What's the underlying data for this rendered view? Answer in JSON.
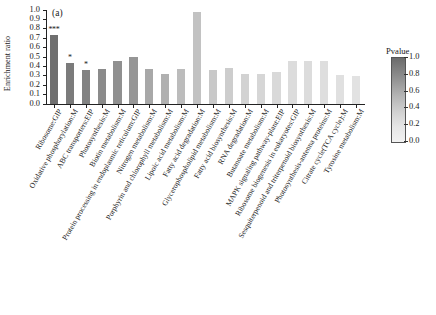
{
  "panel": {
    "letter": "(a)"
  },
  "axis": {
    "ylabel": "Enrichment ratio",
    "yticks": [
      "1.0",
      "0.9",
      "0.8",
      "0.7",
      "0.6",
      "0.5",
      "0.4",
      "0.3",
      "0.2",
      "0.1",
      "0.0"
    ]
  },
  "colorbar": {
    "title": "Pvalue",
    "ticks": [
      "1.0",
      "0.8",
      "0.6",
      "0.4",
      "0.2",
      "0.0"
    ],
    "dark_end": "#6b6b6b",
    "light_end": "#f2f2f2"
  },
  "chart_data": {
    "type": "bar",
    "title": "",
    "xlabel": "",
    "ylabel": "Enrichment ratio",
    "ylim": [
      0.0,
      1.0
    ],
    "grid": false,
    "legend": {
      "title": "Pvalue",
      "position": "right",
      "range": [
        0.0,
        1.0
      ],
      "colormap": "grayscale, dark = 1.0, light = 0.0"
    },
    "categories": [
      "Ribosome:GIP",
      "Oxidative phosphorylation:M",
      "ABC transporters:EIP",
      "Photosynthesis:M",
      "Biotin metabolism:M",
      "Protein processing in endoplasmic reticulum:GIP",
      "Nitrogen metabolism:M",
      "Porphyrin and chlorophyll metabolism:M",
      "Lipoic acid metabolism:M",
      "Fatty acid degradation:M",
      "Glycerophospholipid metabolism:M",
      "Fatty acid biosynthesis:M",
      "RNA degradation:M",
      "Butanoate metabolism:M",
      "MAPK signaling pathway-plant:EIP",
      "Ribosome biogenesis in eukaryotes:GIP",
      "Sesquiterpenoid and triterpenoid biosynthesis:M",
      "Photosynthesis-antenna proteins:M",
      "Citrate cycle(TCA cycle):M",
      "Tyrosine metabolism:M"
    ],
    "values": [
      0.73,
      0.43,
      0.36,
      0.37,
      0.45,
      0.49,
      0.37,
      0.31,
      0.37,
      0.97,
      0.36,
      0.38,
      0.31,
      0.31,
      0.33,
      0.45,
      0.45,
      0.45,
      0.3,
      0.29
    ],
    "pvalues": [
      0.05,
      0.14,
      0.16,
      0.28,
      0.32,
      0.38,
      0.55,
      0.62,
      0.7,
      0.72,
      0.76,
      0.8,
      0.82,
      0.84,
      0.86,
      0.88,
      0.88,
      0.89,
      0.9,
      0.91
    ],
    "bar_colors": [
      "#6f6f6f",
      "#7b7b7b",
      "#828282",
      "#8b8b8b",
      "#909090",
      "#969696",
      "#a8a8a8",
      "#b0b0b0",
      "#bcbcbc",
      "#c2c2c2",
      "#c8c8c8",
      "#cdcdcd",
      "#d2d2d2",
      "#d6d6d6",
      "#d9d9d9",
      "#dcdcdc",
      "#dcdcdc",
      "#dedede",
      "#e0e0e0",
      "#e2e2e2"
    ],
    "significance": [
      "***",
      "*",
      "*",
      "",
      "",
      "",
      "",
      "",
      "",
      "",
      "",
      "",
      "",
      "",
      "",
      "",
      "",
      "",
      "",
      ""
    ],
    "annotations": [
      "*** above bar 1 (Ribosome:GIP)",
      "* above bar 2 (Oxidative phosphorylation:M)",
      "* above bar 3 (ABC transporters:EIP)"
    ]
  }
}
